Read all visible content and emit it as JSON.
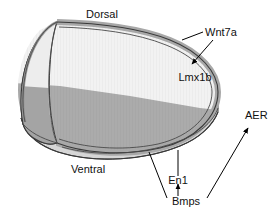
{
  "figure": {
    "type": "biological-schematic"
  },
  "labels": {
    "dorsal": "Dorsal",
    "ventral": "Ventral",
    "wnt7a": "Wnt7a",
    "lmx1b": "Lmx1b",
    "aer": "AER",
    "en1": "En1",
    "bmps": "Bmps"
  },
  "colors": {
    "background": "#ffffff",
    "dorsal_mesenchyme": "#f2f2f2",
    "ventral_mesenchyme": "#ababab",
    "ectoderm_band": "#a8a8a8",
    "ventral_surface": "#d6d6d6",
    "cut_face_dorsal": "#ededed",
    "cut_face_ventral": "#a4a4a4",
    "outline": "#3a3a3a",
    "text": "#111111"
  }
}
